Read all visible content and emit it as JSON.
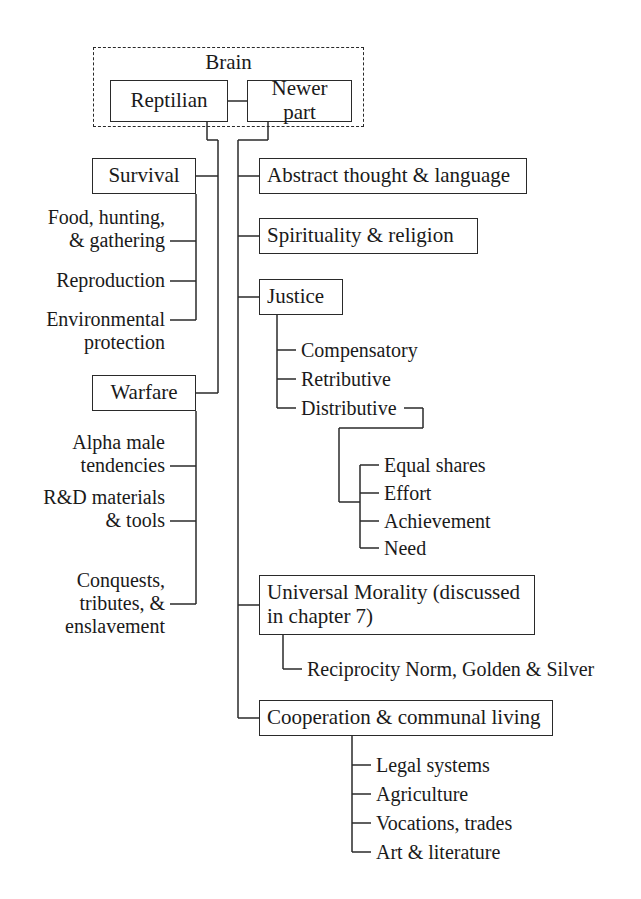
{
  "diagram": {
    "title": "Brain",
    "root_group_label": "Brain",
    "nodes": {
      "reptilian": "Reptilian",
      "newer_part": "Newer part",
      "survival": "Survival",
      "warfare": "Warfare",
      "abstract_thought": "Abstract thought & language",
      "spirituality": "Spirituality & religion",
      "justice": "Justice",
      "universal_morality": "Universal Morality (discussed in chapter 7)",
      "cooperation": "Cooperation & communal living"
    },
    "survival_items": [
      "Food, hunting,\n& gathering",
      "Reproduction",
      "Environmental\nprotection"
    ],
    "warfare_items": [
      "Alpha male\ntendencies",
      "R&D materials\n& tools",
      "Conquests,\ntributes, &\nenslavement"
    ],
    "justice_items": [
      "Compensatory",
      "Retributive",
      "Distributive"
    ],
    "distributive_items": [
      "Equal shares",
      "Effort",
      "Achievement",
      "Need"
    ],
    "morality_items": [
      "Reciprocity Norm, Golden & Silver"
    ],
    "cooperation_items": [
      "Legal systems",
      "Agriculture",
      "Vocations, trades",
      "Art & literature"
    ],
    "colors": {
      "line": "#2a2a2a",
      "text": "#1a1a1a",
      "background": "#ffffff"
    }
  }
}
